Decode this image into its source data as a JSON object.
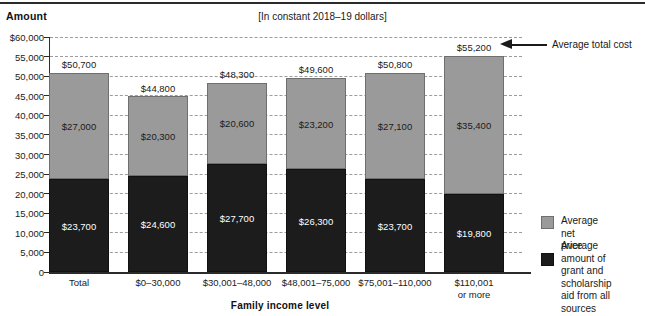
{
  "header": {
    "amount_label": "Amount",
    "units_note": "[In constant 2018–19 dollars]"
  },
  "axes": {
    "x_title": "Family income level"
  },
  "callout": {
    "text": "Average total cost"
  },
  "legend": {
    "items": [
      {
        "label": "Average net price",
        "color": "#9a9a9a"
      },
      {
        "label": "Average amount of\ngrant and scholarship\naid from all sources",
        "color": "#1c1c1c"
      }
    ]
  },
  "chart_data": {
    "type": "bar",
    "stacked": true,
    "title": "",
    "subtitle": "[In constant 2018–19 dollars]",
    "xlabel": "Family income level",
    "ylabel": "Amount",
    "ylim": [
      0,
      60000
    ],
    "ytick_values": [
      60000,
      55000,
      50000,
      45000,
      40000,
      35000,
      30000,
      25000,
      20000,
      15000,
      10000,
      5000,
      0
    ],
    "ytick_labels": [
      "$60,000",
      "55,000",
      "50,000",
      "45,000",
      "40,000",
      "35,000",
      "30,000",
      "25,000",
      "20,000",
      "15,000",
      "10,000",
      "5,000",
      "0"
    ],
    "grid": "horizontal-dashed",
    "legend_position": "right",
    "categories": [
      "Total",
      "$0–30,000",
      "$30,001–48,000",
      "$48,001–75,000",
      "$75,001–110,000",
      "$110,001\nor more"
    ],
    "series": [
      {
        "name": "Average amount of grant and scholarship aid from all sources",
        "color": "#1c1c1c",
        "values": [
          23700,
          24600,
          27700,
          26300,
          23700,
          19800
        ],
        "labels": [
          "$23,700",
          "$24,600",
          "$27,700",
          "$26,300",
          "$23,700",
          "$19,800"
        ]
      },
      {
        "name": "Average net price",
        "color": "#9a9a9a",
        "values": [
          27000,
          20300,
          20600,
          23200,
          27100,
          35400
        ],
        "labels": [
          "$27,000",
          "$20,300",
          "$20,600",
          "$23,200",
          "$27,100",
          "$35,400"
        ]
      }
    ],
    "totals": [
      50700,
      44800,
      48300,
      49600,
      50800,
      55200
    ],
    "total_labels": [
      "$50,700",
      "$44,800",
      "$48,300",
      "$49,600",
      "$50,800",
      "$55,200"
    ],
    "annotation": {
      "text": "Average total cost",
      "points_to": "$55,200"
    }
  }
}
